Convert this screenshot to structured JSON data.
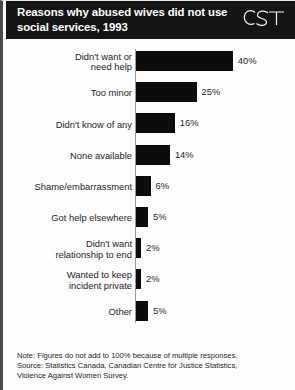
{
  "header": {
    "title_line1": "Reasons why abused wives did not use",
    "title_line2": "social services, 1993",
    "logo_text": "CST"
  },
  "chart_data": {
    "type": "bar",
    "orientation": "horizontal",
    "title": "Reasons why abused wives did not use social services, 1993",
    "xlabel": "",
    "ylabel": "",
    "xlim": [
      0,
      40
    ],
    "grid": false,
    "legend": "none",
    "bar_color": "#0c0c0c",
    "categories": [
      "Didn't want or need help",
      "Too minor",
      "Didn't know of any",
      "None available",
      "Shame/embarrassment",
      "Got help elsewhere",
      "Didn't want relationship to end",
      "Wanted to keep incident private",
      "Other"
    ],
    "values": [
      40,
      25,
      16,
      14,
      6,
      5,
      2,
      2,
      5
    ],
    "value_labels": [
      "40%",
      "25%",
      "16%",
      "14%",
      "6%",
      "5%",
      "2%",
      "2%",
      "5%"
    ],
    "category_label_lines": [
      [
        "Didn't want or",
        "need help"
      ],
      [
        "Too minor"
      ],
      [
        "Didn't know of any"
      ],
      [
        "None available"
      ],
      [
        "Shame/embarrassment"
      ],
      [
        "Got help elsewhere"
      ],
      [
        "Didn't want",
        "relationship to end"
      ],
      [
        "Wanted to keep",
        "incident private"
      ],
      [
        "Other"
      ]
    ]
  },
  "footnote": {
    "line1": "Note: Figures do not add to 100% because of multiple responses.",
    "line2": "Source: Statistics Canada, Canadian Centre for Justice Statistics,",
    "line3": "Violence Against Women Survey."
  }
}
